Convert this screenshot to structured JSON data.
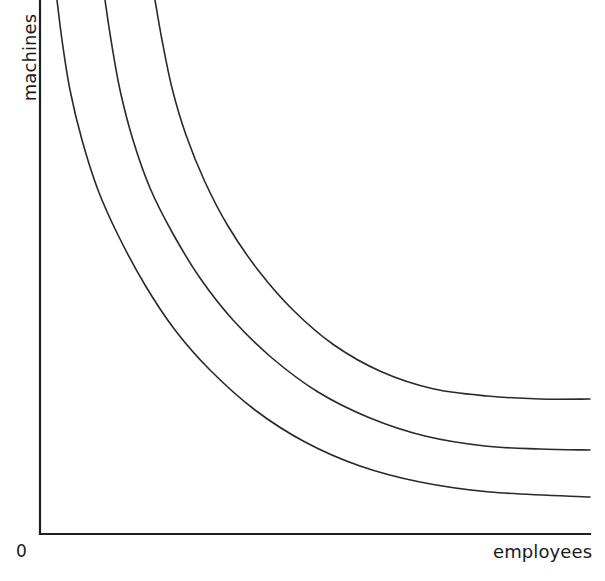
{
  "figure": {
    "kind": "isoquant-diagram",
    "background_color": "#ffffff",
    "line_color": "#2a2a2a",
    "axis_color": "#1f1f1f",
    "origin_label": "0",
    "y_axis_label": "machines",
    "x_axis_label": "employees"
  },
  "chart_data": {
    "type": "line",
    "title": "",
    "subtitle": "",
    "xlabel": "employees",
    "ylabel": "machines",
    "origin_label": "0",
    "grid": false,
    "legend": "none",
    "axes": {
      "x_ticks": [],
      "y_ticks": [],
      "xlim": [
        0,
        1
      ],
      "ylim": [
        0,
        1
      ],
      "x_axis_pixel_start": 40,
      "x_axis_pixel_end": 590,
      "y_axis_pixel_top": 0,
      "y_axis_pixel_bottom": 534
    },
    "series": [
      {
        "name": "isoquant-1",
        "note": "lowest isoquant, nearest the origin",
        "points": [
          [
            57,
            0
          ],
          [
            62,
            40
          ],
          [
            70,
            90
          ],
          [
            82,
            140
          ],
          [
            98,
            190
          ],
          [
            118,
            235
          ],
          [
            145,
            285
          ],
          [
            175,
            330
          ],
          [
            210,
            370
          ],
          [
            255,
            410
          ],
          [
            305,
            442
          ],
          [
            360,
            466
          ],
          [
            420,
            482
          ],
          [
            490,
            492
          ],
          [
            590,
            497
          ]
        ]
      },
      {
        "name": "isoquant-2",
        "note": "middle isoquant",
        "points": [
          [
            105,
            0
          ],
          [
            111,
            40
          ],
          [
            120,
            90
          ],
          [
            133,
            140
          ],
          [
            150,
            188
          ],
          [
            172,
            232
          ],
          [
            200,
            278
          ],
          [
            233,
            320
          ],
          [
            272,
            358
          ],
          [
            318,
            392
          ],
          [
            370,
            418
          ],
          [
            425,
            436
          ],
          [
            485,
            446
          ],
          [
            540,
            449
          ],
          [
            590,
            450
          ]
        ]
      },
      {
        "name": "isoquant-3",
        "note": "highest isoquant, furthest from the origin",
        "points": [
          [
            155,
            0
          ],
          [
            162,
            40
          ],
          [
            172,
            88
          ],
          [
            186,
            135
          ],
          [
            205,
            182
          ],
          [
            228,
            226
          ],
          [
            258,
            270
          ],
          [
            293,
            310
          ],
          [
            334,
            345
          ],
          [
            382,
            372
          ],
          [
            434,
            389
          ],
          [
            488,
            396
          ],
          [
            540,
            399
          ],
          [
            590,
            399
          ]
        ]
      }
    ]
  }
}
